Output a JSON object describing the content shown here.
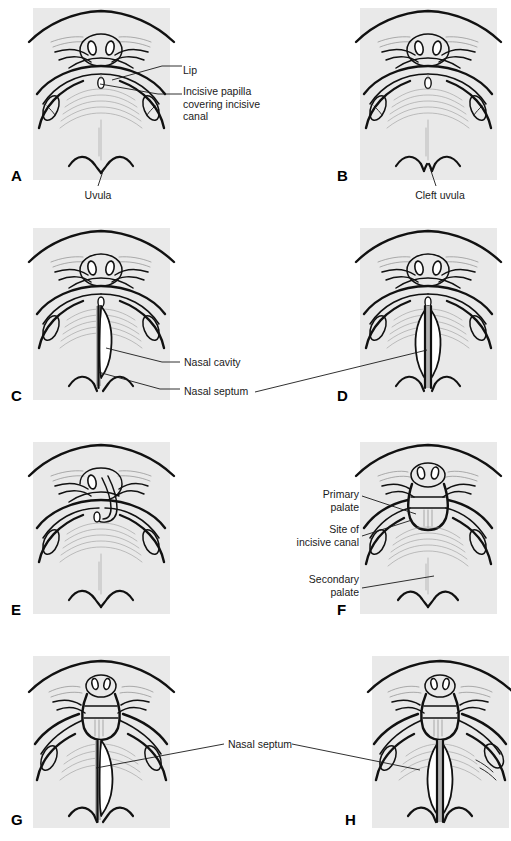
{
  "figure": {
    "panel_background": "#e9e9e9",
    "septum_color": "#b4b4b4",
    "cavity_color": "#ffffff",
    "line_color": "#111111",
    "panels": [
      {
        "id": "A",
        "letter": "A",
        "caption": "Normal lip and palate",
        "labels": [
          {
            "name": "lip",
            "text": "Lip"
          },
          {
            "name": "incisive-papilla",
            "text": "Incisive papilla\ncovering incisive\ncanal"
          },
          {
            "name": "uvula",
            "text": "Uvula"
          }
        ]
      },
      {
        "id": "B",
        "letter": "B",
        "caption": "Cleft uvula",
        "labels": [
          {
            "name": "cleft-uvula",
            "text": "Cleft uvula"
          }
        ]
      },
      {
        "id": "C",
        "letter": "C",
        "caption": "Unilateral cleft of secondary palate",
        "labels": [
          {
            "name": "nasal-cavity",
            "text": "Nasal cavity"
          },
          {
            "name": "nasal-septum",
            "text": "Nasal septum"
          }
        ]
      },
      {
        "id": "D",
        "letter": "D",
        "caption": "Bilateral cleft of secondary palate",
        "labels": []
      },
      {
        "id": "E",
        "letter": "E",
        "caption": "Unilateral cleft lip",
        "labels": []
      },
      {
        "id": "F",
        "letter": "F",
        "caption": "Unilateral cleft lip and primary palate",
        "labels": [
          {
            "name": "primary-palate",
            "text": "Primary\npalate"
          },
          {
            "name": "site-of-incisive-canal",
            "text": "Site of\nincisive canal"
          },
          {
            "name": "secondary-palate",
            "text": "Secondary\npalate"
          }
        ]
      },
      {
        "id": "G",
        "letter": "G",
        "caption": "Unilateral complete cleft lip and palate",
        "labels": []
      },
      {
        "id": "H",
        "letter": "H",
        "caption": "Bilateral complete cleft lip and palate",
        "labels": [
          {
            "name": "nasal-septum",
            "text": "Nasal septum"
          }
        ]
      }
    ],
    "shared_labels": [
      {
        "name": "nasal-cavity-label",
        "text": "Nasal cavity",
        "between": "C-D"
      },
      {
        "name": "nasal-septum-label-cd",
        "text": "Nasal septum",
        "between": "C-D"
      },
      {
        "name": "nasal-septum-label-gh",
        "text": "Nasal septum",
        "between": "G-H"
      }
    ]
  },
  "labels": {
    "lip": "Lip",
    "incisive_papilla": "Incisive papilla\ncovering incisive\ncanal",
    "uvula": "Uvula",
    "cleft_uvula": "Cleft uvula",
    "nasal_cavity": "Nasal cavity",
    "nasal_septum_cd": "Nasal septum",
    "primary_palate": "Primary\npalate",
    "site_incisive_canal": "Site of\nincisive canal",
    "secondary_palate": "Secondary\npalate",
    "nasal_septum_gh": "Nasal septum"
  },
  "letters": {
    "a": "A",
    "b": "B",
    "c": "C",
    "d": "D",
    "e": "E",
    "f": "F",
    "g": "G",
    "h": "H"
  }
}
